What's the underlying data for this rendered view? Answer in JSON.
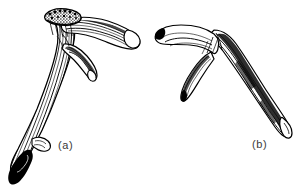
{
  "figure": {
    "kind": "scientific-line-illustration",
    "medium": "pen-and-ink engraving",
    "background_color": "#ffffff",
    "ink_color": "#000000",
    "label_color": "#3a3a3a",
    "width_px": 305,
    "height_px": 195
  },
  "labels": {
    "a": "(a)",
    "b": "(b)"
  },
  "specimens": [
    {
      "id": "a",
      "label": "(a)",
      "name": "antler-a",
      "description": "Left antler with stippled burr at top, long main beam sweeping down to a solid black rounded base, a long forward brow tine and a shorter secondary tine",
      "orientation": "burr upper-centre, beam descending to lower-left",
      "label_position": {
        "x": 58,
        "y": 139
      }
    },
    {
      "id": "b",
      "label": "(b)",
      "name": "antler-b",
      "description": "Right antler with two tines forming a forked crown at upper-left and a long curved beam sweeping down to a tapered point at lower-right",
      "orientation": "crown upper-left, beam descending to lower-right",
      "label_position": {
        "x": 252,
        "y": 138
      }
    }
  ]
}
